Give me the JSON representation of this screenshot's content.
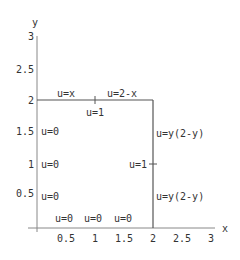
{
  "diagram": {
    "axes": {
      "x_label": "x",
      "y_label": "y",
      "x_ticks": [
        "0.5",
        "1",
        "1.5",
        "2",
        "2.5",
        "3"
      ],
      "y_ticks": [
        "0.5",
        "1",
        "1.5",
        "2",
        "2.5",
        "3"
      ]
    },
    "region": {
      "description": "Square domain [0,2]x[0,2]",
      "color": "#555555"
    },
    "boundary_labels": {
      "top_left": "u=x",
      "top_right": "u=2-x",
      "top_mid_below": "u=1",
      "left_1": "u=0",
      "left_2": "u=0",
      "left_3": "u=0",
      "right_upper": "u=y(2-y)",
      "right_lower": "u=y(2-y)",
      "right_mid_inner": "u=1",
      "bottom_1": "u=0",
      "bottom_2": "u=0",
      "bottom_3": "u=0"
    }
  }
}
